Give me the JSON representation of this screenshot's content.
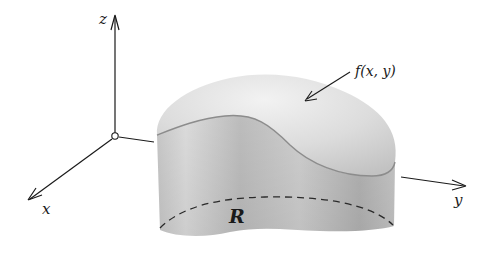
{
  "diagram": {
    "type": "3d-solid-over-region",
    "axes": {
      "x_label": "x",
      "y_label": "y",
      "z_label": "z",
      "color": "#1a1a1a"
    },
    "surface_label": "f(x, y)",
    "region_label": "R",
    "colors": {
      "background": "#ffffff",
      "top_surface_light": "#eeeeee",
      "top_surface_dark": "#bdbdbd",
      "side_light": "#e2e2e2",
      "side_dark": "#a9a9a9",
      "edge": "#8c8c8c",
      "dashed_region": "#2a2a2a"
    }
  }
}
